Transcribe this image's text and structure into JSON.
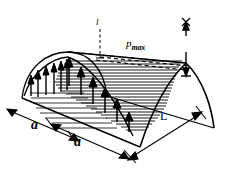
{
  "figure": {
    "type": "engineering-diagram",
    "background_color": "#ffffff",
    "line_color": "#000000",
    "labels": {
      "pressure_symbol": "p",
      "pressure_subscript": "max",
      "span_left": "a",
      "span_right": "a",
      "length": "L",
      "height": "l"
    },
    "dimensions": [
      {
        "name": "span-left",
        "label": "a",
        "orientation": "horizontal-left"
      },
      {
        "name": "span-right",
        "label": "a",
        "orientation": "horizontal-right"
      },
      {
        "name": "roof-length",
        "label": "L",
        "orientation": "diagonal-depth"
      }
    ],
    "annotations": [
      {
        "name": "pmax-arrow",
        "label": "p max",
        "kind": "double-headed-vertical-arrow"
      },
      {
        "name": "height-tick",
        "label": "l",
        "kind": "dashed-vertical-tick"
      }
    ],
    "load_arrows": {
      "front_edge_count": 6,
      "ridge_edge_count": 6,
      "profile": "parabolic"
    },
    "hatch": {
      "surface_line_count": 24,
      "grid_line_count": 8
    }
  }
}
